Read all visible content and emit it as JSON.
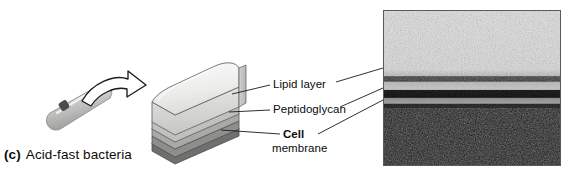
{
  "figure": {
    "caption_letter": "(c)",
    "caption_text": "Acid-fast bacteria",
    "background_color": "#ffffff"
  },
  "labels": {
    "lipid_layer": "Lipid layer",
    "peptidoglycan": "Peptidoglycan",
    "cell": "Cell",
    "membrane": "membrane"
  },
  "diagram": {
    "bacterium_name": "acid-fast-bacillus-rod",
    "arrow_name": "curved-magnification-arrow",
    "block_name": "cell-wall-block-diagram",
    "block_layers": [
      {
        "name": "lipid layer",
        "color": "#ededec"
      },
      {
        "name": "peptidoglycan",
        "color": "#b9b9b7"
      },
      {
        "name": "cell membrane",
        "color": "#8a8a88"
      }
    ],
    "outline_color": "#3a3a3a",
    "leader_line_color": "#1a1a1a"
  },
  "micrograph": {
    "name": "electron-micrograph-cell-envelope",
    "border_color": "#5a5a5a",
    "bands": [
      {
        "name": "lipid layer",
        "tone": "dark thin band",
        "y_fraction": 0.37
      },
      {
        "name": "peptidoglycan",
        "tone": "dense dark band",
        "y_fraction": 0.5
      },
      {
        "name": "cell membrane",
        "tone": "light stripe over dark cytoplasm",
        "y_fraction": 0.6
      }
    ]
  }
}
